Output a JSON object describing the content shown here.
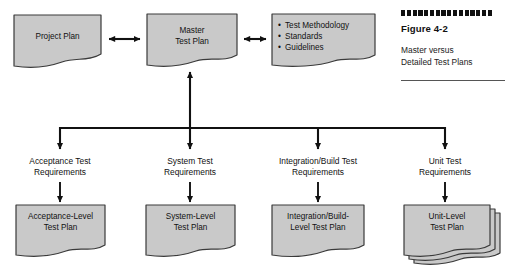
{
  "figure": {
    "caption_title": "Figure 4-2",
    "caption_text": "Master versus\nDetailed Test Plans",
    "dot_count": 16,
    "rule": ""
  },
  "colors": {
    "doc_fill": "#c9c9c9",
    "doc_stroke": "#3a3a3a",
    "connector": "#111111",
    "text": "#111111",
    "background": "#ffffff"
  },
  "top_row": {
    "project_plan": {
      "label": "Project Plan"
    },
    "master_test_plan": {
      "label": "Master\nTest Plan"
    },
    "standards_doc": {
      "bullets": [
        "Test Methodology",
        "Standards",
        "Guidelines"
      ]
    }
  },
  "connectors": {
    "project_to_master": "double-arrow-horizontal",
    "master_to_standards": "double-arrow-horizontal",
    "bus_to_master": "arrow-up",
    "bus": "horizontal-distribution-bus"
  },
  "columns": [
    {
      "requirement_label": "Acceptance Test\nRequirements",
      "plan_label": "Acceptance-Level\nTest Plan",
      "stacked": false
    },
    {
      "requirement_label": "System Test\nRequirements",
      "plan_label": "System-Level\nTest Plan",
      "stacked": false
    },
    {
      "requirement_label": "Integration/Build Test\nRequirements",
      "plan_label": "Integration/Build-\nLevel Test Plan",
      "stacked": false
    },
    {
      "requirement_label": "Unit Test\nRequirements",
      "plan_label": "Unit-Level\nTest Plan",
      "stacked": true
    }
  ]
}
